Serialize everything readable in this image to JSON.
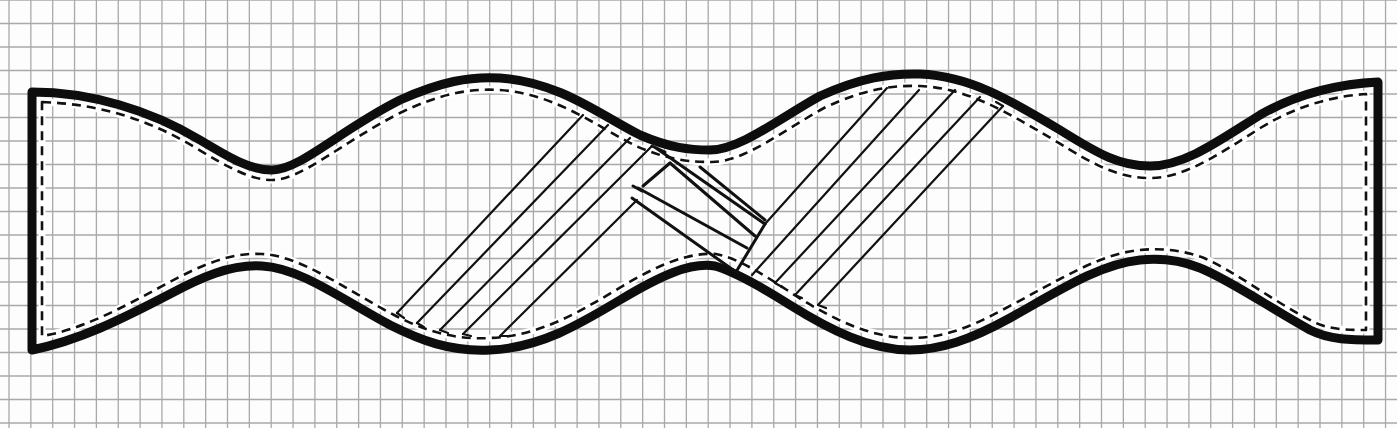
{
  "figure": {
    "title": "Bow tie sewing pattern",
    "paper_color": "#fdfdfd",
    "grid": {
      "color": "#a9a9a9",
      "spacing_x": 21.85,
      "spacing_y": 23.5,
      "offset_x": 9,
      "offset_y": 0
    },
    "outline": {
      "name": "cut-line",
      "color": "#0d0d0d",
      "path": "M 32 92 C 90 92, 150 110, 200 140 C 230 158, 250 170, 272 170 C 300 170, 340 130, 400 100 C 440 82, 470 76, 500 78 C 560 82, 600 115, 640 135 C 670 148, 690 150, 710 150 C 740 150, 780 118, 820 96 C 860 78, 890 73, 920 74 C 970 76, 1010 100, 1060 130 C 1100 155, 1120 166, 1150 166 C 1185 166, 1220 140, 1260 115 C 1300 92, 1340 84, 1378 82 L 1378 340 C 1350 340, 1330 340, 1310 330 C 1270 308, 1230 280, 1200 268 C 1180 260, 1160 258, 1140 260 C 1100 264, 1060 290, 1010 318 C 970 340, 940 350, 910 350 C 870 350, 830 330, 790 305 C 760 286, 735 272, 715 266 C 690 262, 660 276, 620 300 C 580 324, 540 348, 490 350 C 450 352, 420 340, 390 325 C 340 298, 300 268, 262 266 C 230 264, 200 278, 170 294 C 120 320, 80 340, 32 350 Z"
    },
    "seam_allowance": {
      "name": "seam-line",
      "color": "#111111",
      "path": "M 42 102 C 100 104, 150 120, 196 148 C 226 166, 250 180, 272 180 C 302 180, 342 142, 402 112 C 440 94, 470 88, 500 90 C 556 94, 596 126, 636 146 C 668 160, 690 162, 712 162 C 744 162, 784 130, 824 108 C 862 90, 890 85, 920 86 C 968 88, 1006 112, 1054 140 C 1094 165, 1118 178, 1150 178 C 1186 178, 1222 152, 1262 127 C 1300 104, 1336 96, 1366 94 L 1366 330 C 1350 330, 1330 330, 1314 322 C 1274 302, 1236 272, 1204 258 C 1182 250, 1162 248, 1140 250 C 1098 254, 1056 282, 1006 308 C 966 330, 940 338, 910 338 C 872 338, 834 320, 796 296 C 766 276, 738 258, 716 254 C 690 252, 658 264, 616 290 C 576 314, 538 336, 490 338 C 452 340, 424 330, 396 316 C 346 290, 302 256, 262 254 C 228 252, 196 268, 166 284 C 118 310, 80 330, 42 336 Z"
    },
    "hatching": {
      "name": "knot-hatching",
      "left_lines": [
        {
          "x1": 397,
          "y1": 313,
          "x2": 583,
          "y2": 115
        },
        {
          "x1": 417,
          "y1": 323,
          "x2": 608,
          "y2": 125
        },
        {
          "x1": 440,
          "y1": 330,
          "x2": 630,
          "y2": 138
        },
        {
          "x1": 463,
          "y1": 334,
          "x2": 652,
          "y2": 146
        },
        {
          "x1": 500,
          "y1": 336,
          "x2": 637,
          "y2": 200
        }
      ],
      "left_end_caps": [
        {
          "x1": 397,
          "y1": 313,
          "x2": 404,
          "y2": 318
        },
        {
          "x1": 417,
          "y1": 323,
          "x2": 424,
          "y2": 327
        },
        {
          "x1": 440,
          "y1": 330,
          "x2": 448,
          "y2": 333
        },
        {
          "x1": 463,
          "y1": 334,
          "x2": 471,
          "y2": 336
        },
        {
          "x1": 500,
          "y1": 336,
          "x2": 508,
          "y2": 336
        }
      ],
      "knot_lines": [
        {
          "x1": 652,
          "y1": 146,
          "x2": 665,
          "y2": 152
        },
        {
          "x1": 656,
          "y1": 148,
          "x2": 765,
          "y2": 224
        },
        {
          "x1": 670,
          "y1": 163,
          "x2": 755,
          "y2": 236
        },
        {
          "x1": 638,
          "y1": 188,
          "x2": 747,
          "y2": 248
        },
        {
          "x1": 632,
          "y1": 198,
          "x2": 736,
          "y2": 272
        },
        {
          "x1": 700,
          "y1": 167,
          "x2": 765,
          "y2": 220
        },
        {
          "x1": 765,
          "y1": 224,
          "x2": 736,
          "y2": 272
        },
        {
          "x1": 670,
          "y1": 163,
          "x2": 643,
          "y2": 186
        },
        {
          "x1": 633,
          "y1": 186,
          "x2": 642,
          "y2": 191
        }
      ],
      "right_lines": [
        {
          "x1": 765,
          "y1": 224,
          "x2": 887,
          "y2": 88
        },
        {
          "x1": 752,
          "y1": 275,
          "x2": 919,
          "y2": 90
        },
        {
          "x1": 775,
          "y1": 283,
          "x2": 955,
          "y2": 90
        },
        {
          "x1": 795,
          "y1": 295,
          "x2": 980,
          "y2": 97
        },
        {
          "x1": 818,
          "y1": 305,
          "x2": 1003,
          "y2": 106
        }
      ],
      "right_end_caps": [
        {
          "x1": 775,
          "y1": 283,
          "x2": 782,
          "y2": 287
        },
        {
          "x1": 795,
          "y1": 295,
          "x2": 802,
          "y2": 298
        },
        {
          "x1": 818,
          "y1": 305,
          "x2": 826,
          "y2": 308
        },
        {
          "x1": 1003,
          "y1": 106,
          "x2": 996,
          "y2": 102
        }
      ]
    }
  }
}
